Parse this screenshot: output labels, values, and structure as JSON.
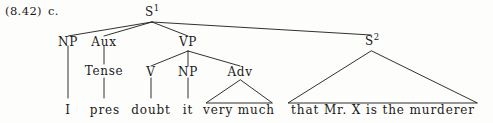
{
  "figure": {
    "example_number": "(8.42)",
    "example_letter": "c.",
    "sentence": "I pres doubt it very much that Mr. X is the murderer",
    "ink_color": "#1a1a1a",
    "background_color": "#fdfdfc"
  },
  "nodes": {
    "s1": {
      "label": "S",
      "superscript": "1"
    },
    "np_subject": {
      "label": "NP"
    },
    "aux": {
      "label": "Aux"
    },
    "vp": {
      "label": "VP"
    },
    "s2": {
      "label": "S",
      "superscript": "2"
    },
    "tense": {
      "label": "Tense"
    },
    "v": {
      "label": "V"
    },
    "np_object": {
      "label": "NP"
    },
    "adv": {
      "label": "Adv"
    }
  },
  "terminals": {
    "i": "I",
    "pres": "pres",
    "doubt": "doubt",
    "it": "it",
    "very_much": "very much",
    "that_clause": "that Mr. X is the murderer"
  }
}
